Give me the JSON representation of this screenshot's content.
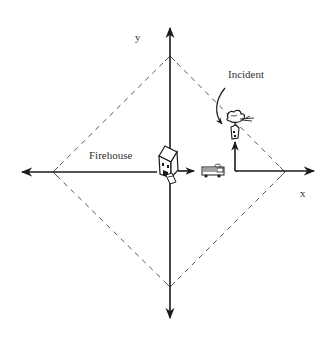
{
  "diagram": {
    "labels": {
      "y_axis": "y",
      "x_axis": "x",
      "incident": "Incident",
      "firehouse": "Firehouse"
    },
    "icons": {
      "firehouse": "house-icon",
      "fire_truck": "fire-truck-icon",
      "incident": "burning-tree-house-icon"
    },
    "colors": {
      "stroke": "#1a1a1a",
      "dashed": "#555555",
      "text": "#333333",
      "background": "#ffffff"
    },
    "geometry": {
      "origin": [
        170,
        172
      ],
      "diamond_vertices": [
        [
          170,
          56
        ],
        [
          285,
          172
        ],
        [
          170,
          287
        ],
        [
          53,
          172
        ]
      ],
      "route": "firehouse -> east along x-axis -> north to incident"
    }
  }
}
